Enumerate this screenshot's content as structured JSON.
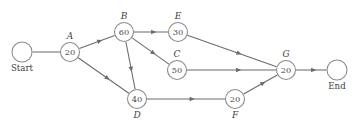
{
  "diagram": {
    "type": "activity-on-node network diagram",
    "title": "",
    "nodes": [
      {
        "id": "start",
        "label": "Start",
        "value": "",
        "x": 22,
        "y": 52,
        "r": 10,
        "label_pos": "below",
        "kind": "terminal"
      },
      {
        "id": "A",
        "label": "A",
        "value": "20",
        "x": 70,
        "y": 52,
        "r": 9.5,
        "label_pos": "above",
        "kind": "activity"
      },
      {
        "id": "B",
        "label": "B",
        "value": "60",
        "x": 124,
        "y": 32,
        "r": 9.5,
        "label_pos": "above",
        "kind": "activity"
      },
      {
        "id": "E",
        "label": "E",
        "value": "30",
        "x": 178,
        "y": 32,
        "r": 9.5,
        "label_pos": "above",
        "kind": "activity"
      },
      {
        "id": "C",
        "label": "C",
        "value": "50",
        "x": 177,
        "y": 70,
        "r": 9.5,
        "label_pos": "above",
        "kind": "activity"
      },
      {
        "id": "G",
        "label": "G",
        "value": "20",
        "x": 286,
        "y": 70,
        "r": 9.5,
        "label_pos": "above",
        "kind": "activity"
      },
      {
        "id": "D",
        "label": "D",
        "value": "40",
        "x": 137,
        "y": 99,
        "r": 9.5,
        "label_pos": "below",
        "kind": "activity"
      },
      {
        "id": "F",
        "label": "F",
        "value": "20",
        "x": 235,
        "y": 99,
        "r": 9.5,
        "label_pos": "below",
        "kind": "activity"
      },
      {
        "id": "end",
        "label": "End",
        "value": "",
        "x": 337,
        "y": 70,
        "r": 10,
        "label_pos": "below",
        "kind": "terminal"
      }
    ],
    "edges": [
      {
        "from": "start",
        "to": "A",
        "arrow": false
      },
      {
        "from": "A",
        "to": "B",
        "arrow": true
      },
      {
        "from": "A",
        "to": "D",
        "arrow": true
      },
      {
        "from": "B",
        "to": "E",
        "arrow": true
      },
      {
        "from": "B",
        "to": "C",
        "arrow": true
      },
      {
        "from": "B",
        "to": "D",
        "arrow": true
      },
      {
        "from": "E",
        "to": "G",
        "arrow": true
      },
      {
        "from": "C",
        "to": "G",
        "arrow": true
      },
      {
        "from": "D",
        "to": "F",
        "arrow": true
      },
      {
        "from": "F",
        "to": "G",
        "arrow": true
      },
      {
        "from": "G",
        "to": "end",
        "arrow": true
      }
    ],
    "colors": {
      "line": "#6b6b6b",
      "node_stroke": "#8a8a8a",
      "node_fill": "#ffffff",
      "text": "#3f3f3f",
      "background": "#ffffff"
    }
  }
}
